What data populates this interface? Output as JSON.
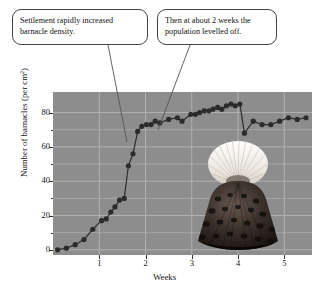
{
  "callouts": [
    {
      "name": "settlement",
      "line1": "Settlement rapidly increased",
      "line2": "barnacle density."
    },
    {
      "name": "levelled",
      "line1": "Then at about 2 weeks the",
      "line2": "population levelled off."
    }
  ],
  "photo": {
    "caption": "barnacle-photograph"
  },
  "colors": {
    "plot_background": "#8d8d8d",
    "gridline": "#b2b2b2",
    "marker": "#2b2b2b",
    "line": "#2b2b2b",
    "callout_border": "#444444",
    "text": "#111111"
  },
  "chart_data": {
    "type": "line",
    "title": "",
    "xlabel": "Weeks",
    "ylabel": "Number of barnacles (per cm²)",
    "xlim": [
      0,
      5.6
    ],
    "ylim": [
      -3,
      92
    ],
    "xticks": [
      1,
      2,
      3,
      4,
      5
    ],
    "xticklabels": [
      "1",
      "2",
      "3",
      "4",
      "5"
    ],
    "yticks": [
      0,
      20,
      40,
      60,
      80
    ],
    "yticklabels": [
      "0",
      "20",
      "40",
      "60",
      "80"
    ],
    "y_minor_ticks": [
      10,
      30,
      50,
      70
    ],
    "grid": true,
    "legend": false,
    "markers": "filled-circle",
    "series": [
      {
        "name": "Barnacle density",
        "x": [
          0.1,
          0.29,
          0.48,
          0.67,
          0.86,
          1.05,
          1.15,
          1.25,
          1.34,
          1.44,
          1.54,
          1.63,
          1.73,
          1.83,
          1.92,
          2.02,
          2.12,
          2.21,
          2.31,
          2.5,
          2.69,
          2.79,
          2.98,
          3.08,
          3.17,
          3.27,
          3.37,
          3.46,
          3.56,
          3.65,
          3.75,
          3.85,
          3.94,
          4.04,
          4.14,
          4.33,
          4.52,
          4.71,
          4.9,
          5.09,
          5.28,
          5.47
        ],
        "y": [
          0,
          1,
          3,
          6,
          12,
          17,
          18,
          22,
          25,
          29,
          30,
          49,
          56,
          69,
          72,
          73,
          73,
          75,
          74,
          76,
          77,
          75,
          79,
          79,
          80,
          81,
          81,
          82,
          83,
          82,
          84,
          85,
          84,
          85,
          68,
          75,
          73,
          73,
          75,
          77,
          76,
          77
        ]
      }
    ],
    "annotations": [
      {
        "text": "Settlement rapidly increased barnacle density.",
        "points_to_x": 1.55,
        "points_to_y": 50
      },
      {
        "text": "Then at about 2 weeks the population levelled off.",
        "points_to_x": 2.25,
        "points_to_y": 75
      }
    ]
  }
}
